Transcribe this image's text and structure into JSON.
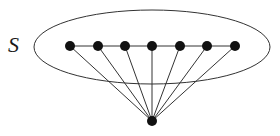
{
  "diagram": {
    "set_label": "S",
    "colors": {
      "stroke": "#333333",
      "node": "#111111",
      "background": "#ffffff"
    },
    "ellipse": {
      "cx": 152,
      "cy": 47,
      "rx": 118,
      "ry": 37
    },
    "path_nodes": [
      {
        "x": 70,
        "y": 46
      },
      {
        "x": 98,
        "y": 46
      },
      {
        "x": 125,
        "y": 46
      },
      {
        "x": 152,
        "y": 46
      },
      {
        "x": 180,
        "y": 46
      },
      {
        "x": 207,
        "y": 46
      },
      {
        "x": 235,
        "y": 46
      }
    ],
    "apex_node": {
      "x": 152,
      "y": 121
    },
    "node_radius": 5
  }
}
